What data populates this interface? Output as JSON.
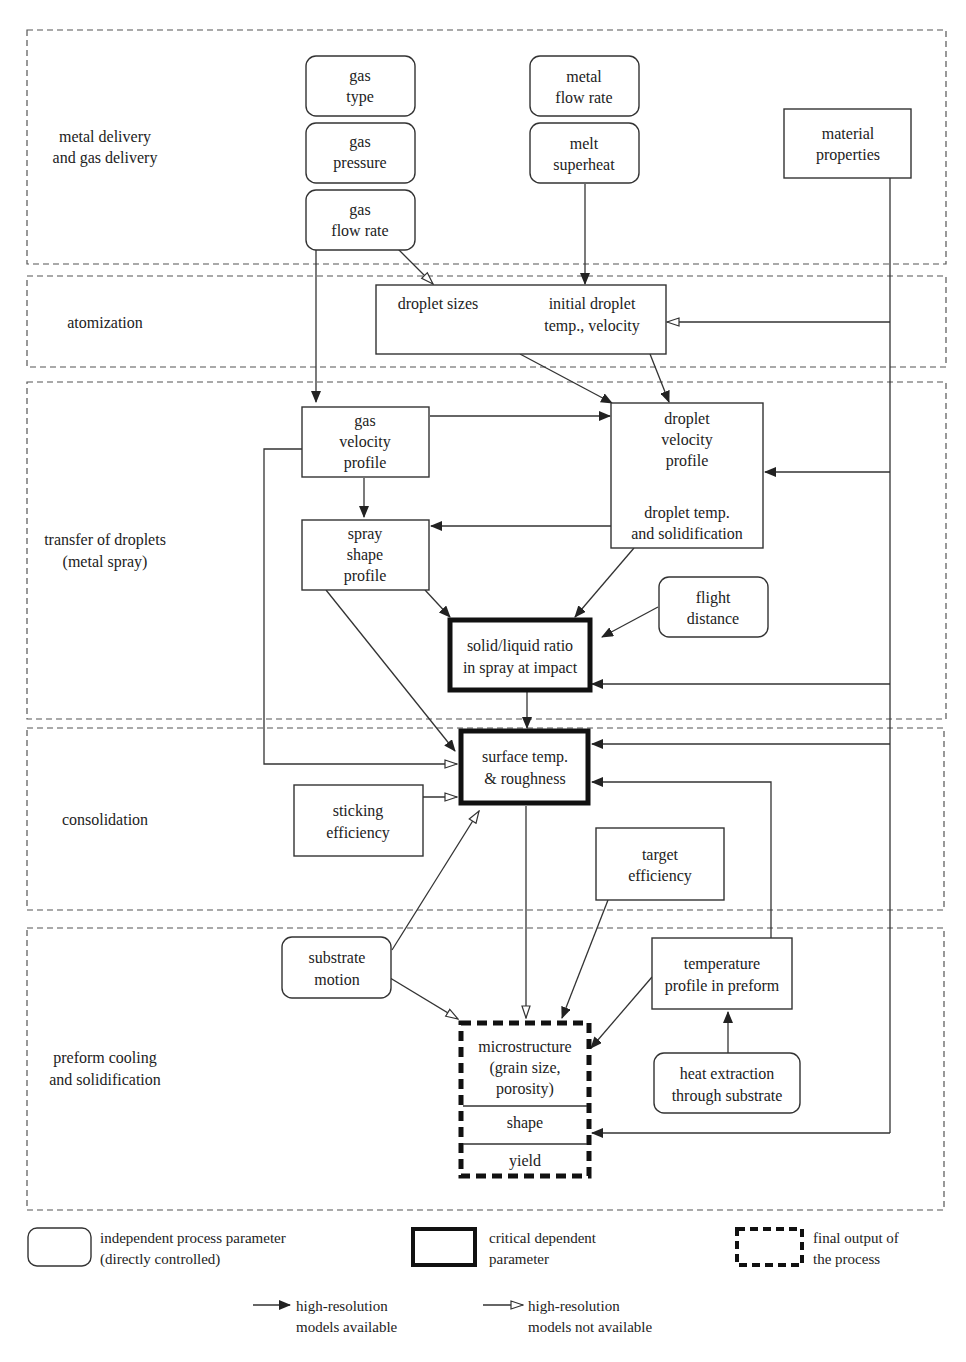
{
  "zones": [
    {
      "id": "metal-gas-delivery",
      "label": [
        "metal delivery",
        "and gas delivery"
      ]
    },
    {
      "id": "atomization",
      "label": [
        "atomization"
      ]
    },
    {
      "id": "transfer-droplets",
      "label": [
        "transfer of droplets",
        "(metal spray)"
      ]
    },
    {
      "id": "consolidation",
      "label": [
        "consolidation"
      ]
    },
    {
      "id": "preform-cooling",
      "label": [
        "preform cooling",
        "and solidification"
      ]
    }
  ],
  "nodes": {
    "gas_type": {
      "type": "independent",
      "lines": [
        "gas",
        "type"
      ]
    },
    "gas_pressure": {
      "type": "independent",
      "lines": [
        "gas",
        "pressure"
      ]
    },
    "gas_flow_rate": {
      "type": "independent",
      "lines": [
        "gas",
        "flow rate"
      ]
    },
    "metal_flow_rate": {
      "type": "independent",
      "lines": [
        "metal",
        "flow rate"
      ]
    },
    "melt_superheat": {
      "type": "independent",
      "lines": [
        "melt",
        "superheat"
      ]
    },
    "material_properties": {
      "type": "dependent",
      "lines": [
        "material",
        "properties"
      ]
    },
    "atomization_box": {
      "type": "dependent",
      "left": "droplet sizes",
      "right": [
        "initial droplet",
        "temp., velocity"
      ]
    },
    "gas_velocity_profile": {
      "type": "dependent",
      "lines": [
        "gas",
        "velocity",
        "profile"
      ]
    },
    "droplet_profile": {
      "type": "dependent",
      "top": [
        "droplet",
        "velocity",
        "profile"
      ],
      "bottom": [
        "droplet temp.",
        "and solidification"
      ]
    },
    "spray_shape_profile": {
      "type": "dependent",
      "lines": [
        "spray",
        "shape",
        "profile"
      ]
    },
    "flight_distance": {
      "type": "independent",
      "lines": [
        "flight",
        "distance"
      ]
    },
    "solid_liquid_ratio": {
      "type": "critical",
      "lines": [
        "solid/liquid ratio",
        "in spray at impact"
      ]
    },
    "surface_temp": {
      "type": "critical",
      "lines": [
        "surface temp.",
        "& roughness"
      ]
    },
    "sticking_efficiency": {
      "type": "dependent",
      "lines": [
        "sticking",
        "efficiency"
      ]
    },
    "target_efficiency": {
      "type": "dependent",
      "lines": [
        "target",
        "efficiency"
      ]
    },
    "substrate_motion": {
      "type": "independent",
      "lines": [
        "substrate",
        "motion"
      ]
    },
    "temperature_profile": {
      "type": "dependent",
      "lines": [
        "temperature",
        "profile in preform"
      ]
    },
    "heat_extraction": {
      "type": "independent",
      "lines": [
        "heat extraction",
        "through substrate"
      ]
    },
    "final_output": {
      "type": "final",
      "sections": [
        [
          "microstructure",
          "(grain size,",
          "porosity)"
        ],
        [
          "shape"
        ],
        [
          "yield"
        ]
      ]
    }
  },
  "legend": {
    "independent": [
      "independent process parameter",
      "(directly controlled)"
    ],
    "critical": [
      "critical dependent",
      "parameter"
    ],
    "final": [
      "final output of",
      "the process"
    ],
    "arrow_filled": [
      "high-resolution",
      "models available"
    ],
    "arrow_open": [
      "high-resolution",
      "models not available"
    ]
  }
}
